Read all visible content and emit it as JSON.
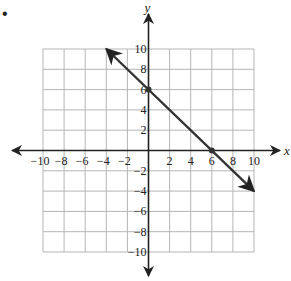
{
  "problem_marker": "•",
  "chart_data": {
    "type": "line",
    "title": "",
    "xlabel": "x",
    "ylabel": "y",
    "xlim": [
      -10,
      10
    ],
    "ylim": [
      -10,
      10
    ],
    "grid": true,
    "grid_step": 2,
    "x_ticks": [
      -10,
      -8,
      -6,
      -4,
      -2,
      2,
      4,
      6,
      8,
      10
    ],
    "y_ticks": [
      10,
      8,
      6,
      4,
      2,
      -2,
      -4,
      -6,
      -8,
      -10
    ],
    "series": [
      {
        "name": "line",
        "equation": "y = -x + 6",
        "x": [
          -4,
          10
        ],
        "y": [
          10,
          -4
        ],
        "arrows": "both",
        "color": "#333333"
      }
    ],
    "points": [
      {
        "x": 0,
        "y": 6,
        "label": "y-intercept"
      },
      {
        "x": 6,
        "y": 0,
        "label": "x-intercept"
      }
    ]
  },
  "colors": {
    "grid": "#b5b5b5",
    "axis": "#222222",
    "line": "#333333"
  }
}
